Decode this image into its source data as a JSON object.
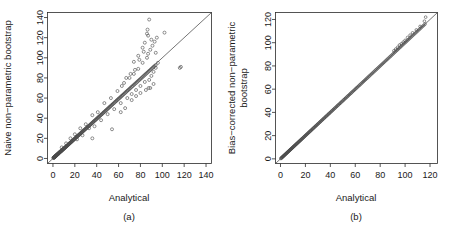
{
  "figure": {
    "marker_style": "open-circle",
    "reference_line": "identity y = x",
    "colors": {
      "axis": "#2b2b2b",
      "marker": "#4a4a4a",
      "line": "#3a3a3a",
      "background": "#ffffff"
    }
  },
  "chart_data": [
    {
      "type": "scatter",
      "panel": "a",
      "caption": "(a)",
      "title": "",
      "xlabel": "Analytical",
      "ylabel": "Naive non−parametric bootstrap",
      "xlim": [
        -5,
        145
      ],
      "ylim": [
        -5,
        145
      ],
      "xticks": [
        0,
        20,
        40,
        60,
        80,
        100,
        120,
        140
      ],
      "yticks": [
        0,
        20,
        40,
        60,
        80,
        100,
        120,
        140
      ],
      "grid": false,
      "legend": "none",
      "annotations": [
        "identity reference line drawn from origin to upper right"
      ],
      "x": [
        0.4,
        0.6,
        0.8,
        0.9,
        1.1,
        1.2,
        1.3,
        1.5,
        1.6,
        1.8,
        1.9,
        2.1,
        2.2,
        2.4,
        2.5,
        2.7,
        2.8,
        3.0,
        3.1,
        3.3,
        3.4,
        3.6,
        3.8,
        3.9,
        4.1,
        4.3,
        4.4,
        4.6,
        4.8,
        5.0,
        5.2,
        5.4,
        5.6,
        5.8,
        6.0,
        6.2,
        6.4,
        6.6,
        6.9,
        7.1,
        7.3,
        7.6,
        7.8,
        8.0,
        8.3,
        8.5,
        8.8,
        9.0,
        9.3,
        9.6,
        9.8,
        10.1,
        10.4,
        10.7,
        11.0,
        11.3,
        11.6,
        11.9,
        12.2,
        12.5,
        12.8,
        13.1,
        13.5,
        13.8,
        14.1,
        14.5,
        14.8,
        15.2,
        15.5,
        15.9,
        16.2,
        16.6,
        17.0,
        17.4,
        17.8,
        18.2,
        18.6,
        19.0,
        19.4,
        19.8,
        20.2,
        20.6,
        21.0,
        21.4,
        21.8,
        22.2,
        22.6,
        23.0,
        23.5,
        23.9,
        24.3,
        24.8,
        25.2,
        25.7,
        26.1,
        26.6,
        27.0,
        27.5,
        28.0,
        28.4,
        28.9,
        29.4,
        29.9,
        30.4,
        30.9,
        31.4,
        31.9,
        32.4,
        33.0,
        33.5,
        34.0,
        34.6,
        35.1,
        35.7,
        36.2,
        36.8,
        37.3,
        37.9,
        38.5,
        39.1,
        39.7,
        40.3,
        40.9,
        41.5,
        42.1,
        42.7,
        43.3,
        44.0,
        44.6,
        45.2,
        45.9,
        46.5,
        47.2,
        47.9,
        48.5,
        49.2,
        49.9,
        50.6,
        51.3,
        52.0,
        52.7,
        53.4,
        54.1,
        54.8,
        55.6,
        56.3,
        57.0,
        57.8,
        58.5,
        59.3,
        60.0,
        60.8,
        61.6,
        62.3,
        63.1,
        63.9,
        64.7,
        65.5,
        66.3,
        67.1,
        67.9,
        68.7,
        69.6,
        70.4,
        71.2,
        72.1,
        72.9,
        73.8,
        74.6,
        75.5,
        76.4,
        77.2,
        78.1,
        79.0,
        79.9,
        80.8,
        81.7,
        82.6,
        83.5,
        84.4,
        85.3,
        86.3,
        87.2,
        88.1,
        89.1,
        90.0,
        91.0,
        91.9,
        92.9,
        93.9,
        8.0,
        12.0,
        16.0,
        20.0,
        22.0,
        25.0,
        27.0,
        30.0,
        33.0,
        36.0,
        38.0,
        41.0,
        44.0,
        47.0,
        50.0,
        53.0,
        56.0,
        59.0,
        62.0,
        65.0,
        68.0,
        70.0,
        72.0,
        74.0,
        76.0,
        78.0,
        80.0,
        82.0,
        84.0,
        86.0,
        87.0,
        88.0,
        89.0,
        90.0,
        91.0,
        92.0,
        93.0,
        94.0,
        95.0,
        96.0,
        36.0,
        54.0,
        62.0,
        66.0,
        72.0,
        74.0,
        76.0,
        78.0,
        80.0,
        82.0,
        84.0,
        85.0,
        86.0,
        87.0,
        88.0,
        89.0,
        90.0,
        92.0,
        94.0,
        102.0,
        116.0,
        117.0,
        86.5,
        87.5,
        83.0,
        79.0,
        75.0,
        71.0,
        67.0,
        63.0
      ],
      "y": [
        0.5,
        0.7,
        0.8,
        1.0,
        1.0,
        1.3,
        1.2,
        1.6,
        1.5,
        1.9,
        2.0,
        2.0,
        2.3,
        2.3,
        2.6,
        2.6,
        2.9,
        2.9,
        3.2,
        3.2,
        3.5,
        3.5,
        3.7,
        4.0,
        4.0,
        4.2,
        4.5,
        4.5,
        4.7,
        5.1,
        5.0,
        5.5,
        5.5,
        5.9,
        5.9,
        6.3,
        6.3,
        6.7,
        6.7,
        7.2,
        7.1,
        7.4,
        7.9,
        7.8,
        8.1,
        8.6,
        8.5,
        9.1,
        9.0,
        9.4,
        9.9,
        9.8,
        10.2,
        10.5,
        10.7,
        11.0,
        11.4,
        11.6,
        12.0,
        12.2,
        12.5,
        12.9,
        13.2,
        13.5,
        13.9,
        14.2,
        14.6,
        14.9,
        15.3,
        15.6,
        16.0,
        16.3,
        16.7,
        17.1,
        17.5,
        17.9,
        18.3,
        18.7,
        19.1,
        19.5,
        19.9,
        20.3,
        20.7,
        21.2,
        21.5,
        22.0,
        22.3,
        22.8,
        23.1,
        23.6,
        24.0,
        24.4,
        24.9,
        25.3,
        25.8,
        26.2,
        26.7,
        27.1,
        27.6,
        28.1,
        28.5,
        29.0,
        29.5,
        30.0,
        30.4,
        31.0,
        31.4,
        32.0,
        32.4,
        33.0,
        33.5,
        34.0,
        34.6,
        35.1,
        35.7,
        36.2,
        36.8,
        37.3,
        37.9,
        38.5,
        39.1,
        39.7,
        40.3,
        40.9,
        41.5,
        42.1,
        42.7,
        43.3,
        43.9,
        44.6,
        45.2,
        45.9,
        46.5,
        47.2,
        47.8,
        48.5,
        49.2,
        49.9,
        50.6,
        51.3,
        52.0,
        52.7,
        53.4,
        54.1,
        54.8,
        55.6,
        56.3,
        57.0,
        57.8,
        58.5,
        59.3,
        60.0,
        60.8,
        61.6,
        62.3,
        63.1,
        63.9,
        64.7,
        65.5,
        66.3,
        67.1,
        67.9,
        68.7,
        69.5,
        70.4,
        71.2,
        72.0,
        72.9,
        73.7,
        74.6,
        75.4,
        76.3,
        77.2,
        78.0,
        78.9,
        79.8,
        80.7,
        81.6,
        82.5,
        83.4,
        84.3,
        85.2,
        86.2,
        87.1,
        88.0,
        89.0,
        89.9,
        90.9,
        91.8,
        92.8,
        11.0,
        15.0,
        20.0,
        24.0,
        19.0,
        30.0,
        23.0,
        34.0,
        30.0,
        43.0,
        32.0,
        46.0,
        38.0,
        55.0,
        44.0,
        60.0,
        49.0,
        67.0,
        55.0,
        75.0,
        60.0,
        80.0,
        64.0,
        84.0,
        68.0,
        89.0,
        72.0,
        95.0,
        76.0,
        100.0,
        104.0,
        78.0,
        108.0,
        82.0,
        112.0,
        86.0,
        116.0,
        90.0,
        120.0,
        95.0,
        20.0,
        29.0,
        46.0,
        50.0,
        58.0,
        96.0,
        62.0,
        102.0,
        65.0,
        110.0,
        115.0,
        68.0,
        124.0,
        122.0,
        138.0,
        70.0,
        118.0,
        74.0,
        105.0,
        125.0,
        90.0,
        91.0,
        128.0,
        70.0,
        106.0,
        98.0,
        88.0,
        84.0,
        80.0,
        72.0
      ]
    },
    {
      "type": "scatter",
      "panel": "b",
      "caption": "(b)",
      "title": "",
      "xlabel": "Analytical",
      "ylabel": "Bias−corrected non−parametric bootstrap",
      "ylabel_lines": [
        "Bias−corrected non−parametric",
        "bootstrap"
      ],
      "xlim": [
        -4,
        126
      ],
      "ylim": [
        -4,
        126
      ],
      "xticks": [
        0,
        20,
        40,
        60,
        80,
        100,
        120
      ],
      "yticks": [
        0,
        20,
        40,
        60,
        80,
        100,
        120
      ],
      "grid": false,
      "legend": "none",
      "annotations": [
        "points lie almost exactly on the identity line"
      ],
      "x": [
        0.3,
        0.6,
        0.9,
        1.2,
        1.5,
        1.8,
        2.1,
        2.4,
        2.7,
        3.0,
        3.3,
        3.6,
        3.9,
        4.2,
        4.5,
        4.8,
        5.1,
        5.4,
        5.7,
        6.0,
        6.3,
        6.6,
        6.9,
        7.2,
        7.5,
        7.8,
        8.1,
        8.4,
        8.7,
        9.0,
        9.4,
        9.7,
        10.0,
        10.4,
        10.7,
        11.1,
        11.4,
        11.8,
        12.1,
        12.5,
        12.9,
        13.2,
        13.6,
        14.0,
        14.4,
        14.8,
        15.2,
        15.6,
        16.0,
        16.4,
        16.8,
        17.2,
        17.6,
        18.0,
        18.5,
        18.9,
        19.3,
        19.8,
        20.2,
        20.6,
        21.1,
        21.5,
        22.0,
        22.5,
        22.9,
        23.4,
        23.9,
        24.3,
        24.8,
        25.3,
        25.8,
        26.3,
        26.8,
        27.3,
        27.8,
        28.3,
        28.8,
        29.3,
        29.8,
        30.4,
        30.9,
        31.4,
        32.0,
        32.5,
        33.0,
        33.6,
        34.1,
        34.7,
        35.2,
        35.8,
        36.4,
        36.9,
        37.5,
        38.1,
        38.7,
        39.2,
        39.8,
        40.4,
        41.0,
        41.6,
        42.2,
        42.8,
        43.4,
        44.0,
        44.7,
        45.3,
        45.9,
        46.5,
        47.2,
        47.8,
        48.4,
        49.1,
        49.7,
        50.4,
        51.0,
        51.7,
        52.3,
        53.0,
        53.7,
        54.3,
        55.0,
        55.7,
        56.4,
        57.0,
        57.7,
        58.4,
        59.1,
        59.8,
        60.5,
        61.2,
        61.9,
        62.7,
        63.4,
        64.1,
        64.8,
        65.6,
        66.3,
        67.0,
        67.8,
        68.5,
        69.3,
        70.0,
        70.8,
        71.5,
        72.3,
        73.1,
        73.8,
        74.6,
        75.4,
        76.2,
        76.9,
        77.7,
        78.5,
        79.3,
        80.1,
        80.9,
        81.7,
        82.5,
        83.3,
        84.2,
        85.0,
        85.8,
        86.6,
        87.5,
        88.3,
        89.1,
        90.0,
        90.8,
        91.7,
        92.5,
        93.4,
        94.2,
        95.1,
        96.0,
        96.8,
        97.7,
        98.6,
        99.5,
        100.4,
        101.2,
        102.1,
        103.0,
        103.9,
        104.8,
        105.7,
        106.7,
        107.6,
        108.5,
        109.4,
        110.3,
        111.3,
        112.2,
        113.1,
        114.1,
        115.0,
        116.0,
        91.0,
        92.5,
        94.0,
        95.5,
        97.0,
        98.5,
        100.0,
        102.0,
        104.0,
        106.0,
        109.0,
        112.0,
        115.5,
        116.5
      ],
      "y": [
        0.3,
        0.6,
        0.9,
        1.2,
        1.5,
        1.8,
        2.1,
        2.4,
        2.7,
        3.0,
        3.3,
        3.6,
        3.9,
        4.2,
        4.5,
        4.8,
        5.1,
        5.4,
        5.7,
        6.0,
        6.3,
        6.6,
        6.9,
        7.2,
        7.5,
        7.8,
        8.1,
        8.4,
        8.7,
        9.0,
        9.4,
        9.7,
        10.0,
        10.4,
        10.7,
        11.1,
        11.4,
        11.8,
        12.1,
        12.5,
        12.9,
        13.2,
        13.6,
        14.0,
        14.4,
        14.8,
        15.2,
        15.6,
        16.0,
        16.4,
        16.8,
        17.2,
        17.6,
        18.0,
        18.5,
        18.9,
        19.3,
        19.8,
        20.2,
        20.6,
        21.1,
        21.5,
        22.0,
        22.5,
        22.9,
        23.4,
        23.9,
        24.3,
        24.8,
        25.3,
        25.8,
        26.3,
        26.8,
        27.3,
        27.8,
        28.3,
        28.8,
        29.3,
        29.8,
        30.4,
        30.9,
        31.4,
        32.0,
        32.5,
        33.0,
        33.6,
        34.1,
        34.7,
        35.2,
        35.8,
        36.4,
        36.9,
        37.5,
        38.1,
        38.7,
        39.2,
        39.8,
        40.4,
        41.0,
        41.6,
        42.2,
        42.8,
        43.4,
        44.0,
        44.7,
        45.3,
        45.9,
        46.5,
        47.2,
        47.8,
        48.4,
        49.1,
        49.7,
        50.4,
        51.0,
        51.7,
        52.3,
        53.0,
        53.7,
        54.3,
        55.0,
        55.7,
        56.4,
        57.0,
        57.7,
        58.4,
        59.1,
        59.8,
        60.5,
        61.2,
        61.9,
        62.7,
        63.4,
        64.1,
        64.8,
        65.6,
        66.3,
        67.0,
        67.8,
        68.5,
        69.3,
        70.0,
        70.8,
        71.5,
        72.3,
        73.1,
        73.8,
        74.6,
        75.4,
        76.2,
        76.9,
        77.7,
        78.5,
        79.3,
        80.1,
        80.9,
        81.7,
        82.5,
        83.3,
        84.2,
        85.0,
        85.8,
        86.6,
        87.5,
        88.3,
        89.1,
        90.0,
        90.8,
        91.7,
        92.5,
        93.4,
        94.2,
        95.1,
        96.0,
        96.8,
        97.7,
        98.6,
        99.5,
        100.4,
        101.2,
        102.1,
        103.0,
        103.9,
        104.8,
        105.7,
        106.7,
        107.6,
        108.5,
        109.4,
        110.3,
        111.3,
        112.2,
        113.1,
        114.1,
        115.0,
        116.0,
        93.0,
        94.5,
        96.0,
        98.0,
        99.0,
        100.5,
        102.0,
        104.5,
        106.5,
        108.5,
        111.0,
        114.0,
        118.5,
        122.0
      ]
    }
  ]
}
